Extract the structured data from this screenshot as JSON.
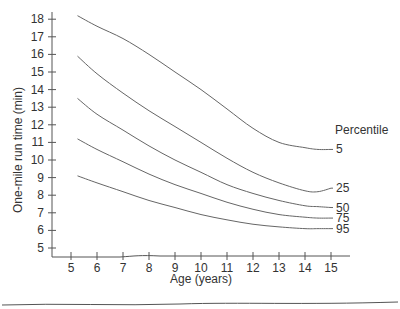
{
  "chart_data": {
    "type": "line",
    "title": "",
    "xlabel": "Age (years)",
    "ylabel": "One-mile run time (min)",
    "xlim": [
      4.5,
      15.8
    ],
    "ylim": [
      4.7,
      18.5
    ],
    "x_ticks": [
      5,
      6,
      7,
      8,
      9,
      10,
      11,
      12,
      13,
      14,
      15
    ],
    "y_ticks": [
      5,
      6,
      7,
      8,
      9,
      10,
      11,
      12,
      13,
      14,
      15,
      16,
      17,
      18
    ],
    "grid": false,
    "legend_title": "Percentile",
    "legend_position": "right, labels at line ends",
    "x": [
      5.25,
      6,
      7,
      8,
      9,
      10,
      11,
      12,
      13,
      14,
      14.5,
      15
    ],
    "series": [
      {
        "name": "5",
        "values": [
          18.2,
          17.6,
          16.9,
          16.0,
          15.0,
          14.0,
          12.9,
          11.8,
          11.0,
          10.7,
          10.6,
          10.6
        ]
      },
      {
        "name": "25",
        "values": [
          15.9,
          14.9,
          13.8,
          12.8,
          11.9,
          11.0,
          10.1,
          9.3,
          8.7,
          8.25,
          8.2,
          8.4
        ]
      },
      {
        "name": "50",
        "values": [
          13.5,
          12.6,
          11.7,
          10.8,
          10.0,
          9.3,
          8.6,
          8.1,
          7.7,
          7.4,
          7.35,
          7.3
        ]
      },
      {
        "name": "75",
        "values": [
          11.2,
          10.6,
          9.9,
          9.2,
          8.6,
          8.1,
          7.6,
          7.2,
          6.9,
          6.75,
          6.7,
          6.7
        ]
      },
      {
        "name": "95",
        "values": [
          9.1,
          8.7,
          8.2,
          7.7,
          7.3,
          6.9,
          6.6,
          6.35,
          6.2,
          6.1,
          6.1,
          6.1
        ]
      }
    ]
  }
}
